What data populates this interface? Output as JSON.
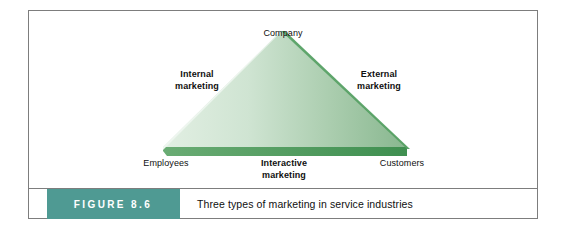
{
  "figure": {
    "tag_label": "FIGURE 8.6",
    "caption": "Three types of marketing in service industries"
  },
  "diagram": {
    "type": "service-marketing-triangle",
    "vertices": {
      "top": "Company",
      "bottom_left": "Employees",
      "bottom_right": "Customers"
    },
    "sides": {
      "left": "Internal marketing",
      "left_line1": "Internal",
      "left_line2": "marketing",
      "right": "External marketing",
      "right_line1": "External",
      "right_line2": "marketing",
      "bottom": "Interactive marketing",
      "bottom_line1": "Interactive",
      "bottom_line2": "marketing"
    }
  },
  "colors": {
    "triangle_fill_light": "#dceade",
    "triangle_fill_mid": "#b9d6bc",
    "triangle_fill_dark": "#8cba93",
    "triangle_base_edge": "#4e9a5c",
    "triangle_right_edge": "#4e9a5c",
    "figure_tag_background": "#4f9a93",
    "figure_tag_text": "#ffffff",
    "frame_border": "#7d7d7d",
    "page_background": "#ffffff",
    "text": "#0f0f0f"
  }
}
